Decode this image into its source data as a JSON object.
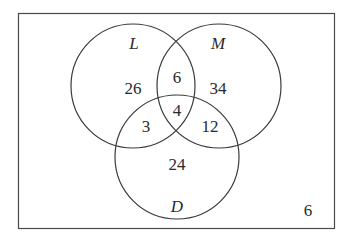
{
  "diagram": {
    "type": "venn-3",
    "universe_count": "6",
    "sets": [
      {
        "name": "L",
        "only": "26"
      },
      {
        "name": "M",
        "only": "34"
      },
      {
        "name": "D",
        "only": "24"
      }
    ],
    "intersections": {
      "L_M_only": "6",
      "L_D_only": "3",
      "M_D_only": "12",
      "L_M_D": "4"
    },
    "colors": {
      "stroke": "#3a3a3a",
      "text": "#2a2a2a",
      "background": "#ffffff"
    }
  }
}
